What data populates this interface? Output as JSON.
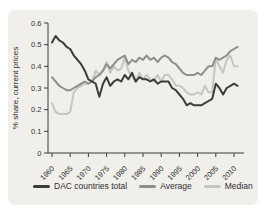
{
  "panel": {
    "background": "#f0efeb"
  },
  "chart_data": {
    "type": "line",
    "title": "",
    "xlabel": "",
    "ylabel": "% share, current prices",
    "x_start": 1960,
    "x_end": 2011,
    "x_ticks": [
      1960,
      1965,
      1970,
      1975,
      1980,
      1985,
      1990,
      1995,
      2000,
      2005,
      2010
    ],
    "y_ticks": [
      0,
      0.1,
      0.2,
      0.3,
      0.4,
      0.5,
      0.6
    ],
    "ylim": [
      0,
      0.6
    ],
    "grid": false,
    "legend_position": "bottom",
    "axis_color": "#3a3a38",
    "tick_label_color": "#333333",
    "series": [
      {
        "name": "DAC countries total",
        "color": "#3c3c3a",
        "values": [
          0.51,
          0.54,
          0.52,
          0.51,
          0.49,
          0.48,
          0.45,
          0.43,
          0.41,
          0.38,
          0.34,
          0.33,
          0.32,
          0.26,
          0.32,
          0.35,
          0.31,
          0.33,
          0.34,
          0.33,
          0.36,
          0.34,
          0.37,
          0.33,
          0.35,
          0.34,
          0.34,
          0.33,
          0.34,
          0.32,
          0.33,
          0.33,
          0.33,
          0.3,
          0.29,
          0.27,
          0.25,
          0.22,
          0.23,
          0.22,
          0.22,
          0.22,
          0.23,
          0.24,
          0.25,
          0.32,
          0.3,
          0.27,
          0.3,
          0.31,
          0.32,
          0.31
        ]
      },
      {
        "name": "Average",
        "color": "#8f8e8a",
        "values": [
          0.35,
          0.33,
          0.31,
          0.3,
          0.29,
          0.29,
          0.3,
          0.31,
          0.32,
          0.33,
          0.32,
          0.33,
          0.35,
          0.36,
          0.38,
          0.41,
          0.39,
          0.41,
          0.43,
          0.44,
          0.45,
          0.41,
          0.43,
          0.42,
          0.44,
          0.43,
          0.45,
          0.43,
          0.44,
          0.42,
          0.44,
          0.45,
          0.44,
          0.42,
          0.41,
          0.39,
          0.37,
          0.36,
          0.36,
          0.36,
          0.37,
          0.36,
          0.38,
          0.4,
          0.4,
          0.44,
          0.43,
          0.44,
          0.45,
          0.47,
          0.48,
          0.49
        ]
      },
      {
        "name": "Median",
        "color": "#c6c5c0",
        "values": [
          0.23,
          0.19,
          0.18,
          0.18,
          0.18,
          0.19,
          0.28,
          0.3,
          0.31,
          0.32,
          0.32,
          0.33,
          0.38,
          0.36,
          0.38,
          0.42,
          0.37,
          0.4,
          0.38,
          0.39,
          0.44,
          0.38,
          0.35,
          0.33,
          0.37,
          0.34,
          0.36,
          0.34,
          0.33,
          0.36,
          0.33,
          0.36,
          0.36,
          0.34,
          0.31,
          0.31,
          0.3,
          0.28,
          0.27,
          0.27,
          0.28,
          0.27,
          0.31,
          0.28,
          0.28,
          0.44,
          0.4,
          0.37,
          0.43,
          0.45,
          0.4,
          0.4
        ]
      }
    ]
  }
}
